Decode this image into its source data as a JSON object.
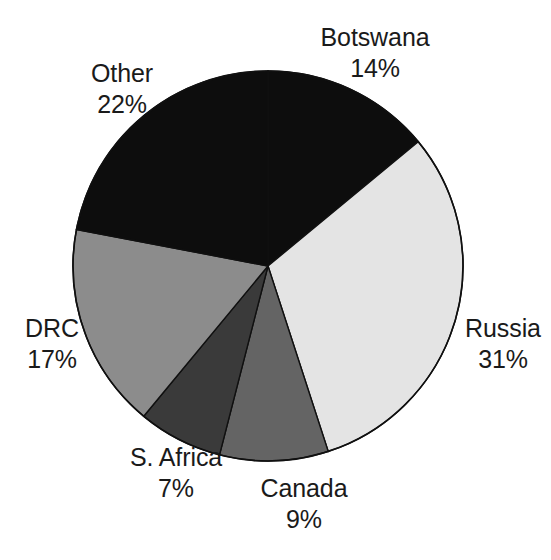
{
  "chart_data": {
    "type": "pie",
    "title": "",
    "subtitle": "",
    "xlabel": "",
    "ylabel": "",
    "units": "percent",
    "legend_position": "none",
    "grid": false,
    "start_angle_deg": 0,
    "direction": "clockwise",
    "total": 100,
    "categories": [
      "Botswana",
      "Russia",
      "Canada",
      "S. Africa",
      "DRC",
      "Other"
    ],
    "values": [
      14,
      31,
      9,
      7,
      17,
      22
    ],
    "value_labels": [
      "14%",
      "31%",
      "9%",
      "7%",
      "17%",
      "22%"
    ],
    "colors": [
      "#0d0d0d",
      "#e4e4e4",
      "#646464",
      "#3a3a3a",
      "#8c8c8c",
      "#0d0d0d"
    ],
    "slices": [
      {
        "label": "Botswana",
        "value": 14,
        "value_label": "14%",
        "color": "#0d0d0d",
        "start_deg": 0.0,
        "end_deg": 50.4
      },
      {
        "label": "Russia",
        "value": 31,
        "value_label": "31%",
        "color": "#e4e4e4",
        "start_deg": 50.4,
        "end_deg": 162.0
      },
      {
        "label": "Canada",
        "value": 9,
        "value_label": "9%",
        "color": "#646464",
        "start_deg": 162.0,
        "end_deg": 194.4
      },
      {
        "label": "S. Africa",
        "value": 7,
        "value_label": "7%",
        "color": "#3a3a3a",
        "start_deg": 194.4,
        "end_deg": 219.6
      },
      {
        "label": "DRC",
        "value": 17,
        "value_label": "17%",
        "color": "#8c8c8c",
        "start_deg": 219.6,
        "end_deg": 280.8
      },
      {
        "label": "Other",
        "value": 22,
        "value_label": "22%",
        "color": "#0d0d0d",
        "start_deg": 280.8,
        "end_deg": 360.0
      }
    ],
    "geometry": {
      "cx": 268,
      "cy": 266,
      "r": 195
    }
  },
  "labels": {
    "botswana": {
      "name": "Botswana",
      "value": "14%"
    },
    "russia": {
      "name": "Russia",
      "value": "31%"
    },
    "canada": {
      "name": "Canada",
      "value": "9%"
    },
    "safrica": {
      "name": "S. Africa",
      "value": "7%"
    },
    "drc": {
      "name": "DRC",
      "value": "17%"
    },
    "other": {
      "name": "Other",
      "value": "22%"
    }
  },
  "style": {
    "background": "#ffffff",
    "outline": "#101010",
    "text": "#1a1a1a"
  }
}
